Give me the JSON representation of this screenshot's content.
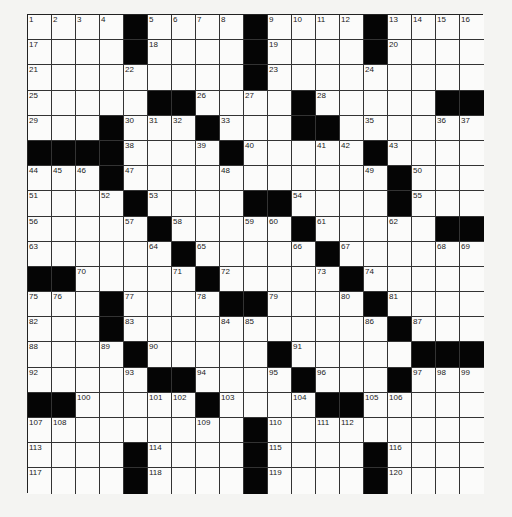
{
  "puzzle": {
    "rows": 19,
    "cols": 19,
    "colors": {
      "block": "#050505",
      "cell": "#fbfbfa",
      "line": "#333333"
    },
    "grid": [
      "....#....#....#....",
      "....#....#....#....",
      ".........#.........",
      ".....##....#.....##",
      "...#...#...##......",
      "####....#.....#....",
      "...#...........#...",
      "....#....##....#...",
      ".....#.....#.....##",
      "......#.....#......",
      "##.....#.....#.....",
      "...#....##....#....",
      "...#...........#...",
      "....#.....#.....####",
      ".....##....#...#...",
      "##.....#....##.....",
      ".........#.........",
      "....#....#....#....",
      "....#....#....#...."
    ],
    "numbers": [
      [
        1,
        2,
        3,
        4,
        0,
        5,
        6,
        7,
        8,
        0,
        9,
        10,
        11,
        12,
        0,
        13,
        14,
        15,
        16
      ],
      [
        17,
        0,
        0,
        0,
        0,
        18,
        0,
        0,
        0,
        0,
        19,
        0,
        0,
        0,
        0,
        20,
        0,
        0,
        0
      ],
      [
        21,
        0,
        0,
        0,
        22,
        0,
        0,
        0,
        0,
        0,
        23,
        0,
        0,
        0,
        24,
        0,
        0,
        0,
        0
      ],
      [
        25,
        0,
        0,
        0,
        0,
        0,
        0,
        26,
        0,
        27,
        0,
        0,
        28,
        0,
        0,
        0,
        0,
        0,
        0
      ],
      [
        29,
        0,
        0,
        0,
        30,
        31,
        32,
        0,
        33,
        0,
        0,
        34,
        0,
        0,
        35,
        0,
        0,
        36,
        37
      ],
      [
        0,
        0,
        0,
        0,
        38,
        0,
        0,
        39,
        0,
        40,
        0,
        0,
        41,
        42,
        0,
        43,
        0,
        0,
        0
      ],
      [
        44,
        45,
        46,
        0,
        47,
        0,
        0,
        0,
        48,
        0,
        0,
        0,
        0,
        0,
        49,
        0,
        50,
        0,
        0
      ],
      [
        51,
        0,
        0,
        52,
        0,
        53,
        0,
        0,
        0,
        0,
        0,
        54,
        0,
        0,
        0,
        0,
        55,
        0,
        0
      ],
      [
        56,
        0,
        0,
        0,
        57,
        0,
        58,
        0,
        0,
        59,
        60,
        0,
        61,
        0,
        0,
        62,
        0,
        0,
        0
      ],
      [
        63,
        0,
        0,
        0,
        0,
        64,
        0,
        65,
        0,
        0,
        0,
        66,
        0,
        67,
        0,
        0,
        0,
        68,
        69
      ],
      [
        0,
        0,
        70,
        0,
        0,
        0,
        71,
        0,
        72,
        0,
        0,
        0,
        73,
        0,
        74,
        0,
        0,
        0,
        0
      ],
      [
        75,
        76,
        0,
        0,
        77,
        0,
        0,
        78,
        0,
        0,
        79,
        0,
        0,
        80,
        0,
        81,
        0,
        0,
        0
      ],
      [
        82,
        0,
        0,
        0,
        83,
        0,
        0,
        0,
        84,
        85,
        0,
        0,
        0,
        0,
        86,
        0,
        87,
        0,
        0
      ],
      [
        88,
        0,
        0,
        89,
        0,
        90,
        0,
        0,
        0,
        0,
        0,
        91,
        0,
        0,
        0,
        0,
        0,
        0,
        0
      ],
      [
        92,
        0,
        0,
        0,
        93,
        0,
        0,
        94,
        0,
        0,
        95,
        0,
        96,
        0,
        0,
        0,
        97,
        98,
        99
      ],
      [
        0,
        0,
        100,
        0,
        0,
        101,
        102,
        0,
        103,
        0,
        0,
        104,
        0,
        0,
        105,
        106,
        0,
        0,
        0
      ],
      [
        107,
        108,
        0,
        0,
        0,
        0,
        0,
        109,
        0,
        0,
        110,
        0,
        111,
        112,
        0,
        0,
        0,
        0,
        0
      ],
      [
        113,
        0,
        0,
        0,
        0,
        114,
        0,
        0,
        0,
        0,
        115,
        0,
        0,
        0,
        0,
        116,
        0,
        0,
        0
      ],
      [
        117,
        0,
        0,
        0,
        0,
        118,
        0,
        0,
        0,
        0,
        119,
        0,
        0,
        0,
        0,
        120,
        0,
        0,
        0
      ]
    ]
  }
}
